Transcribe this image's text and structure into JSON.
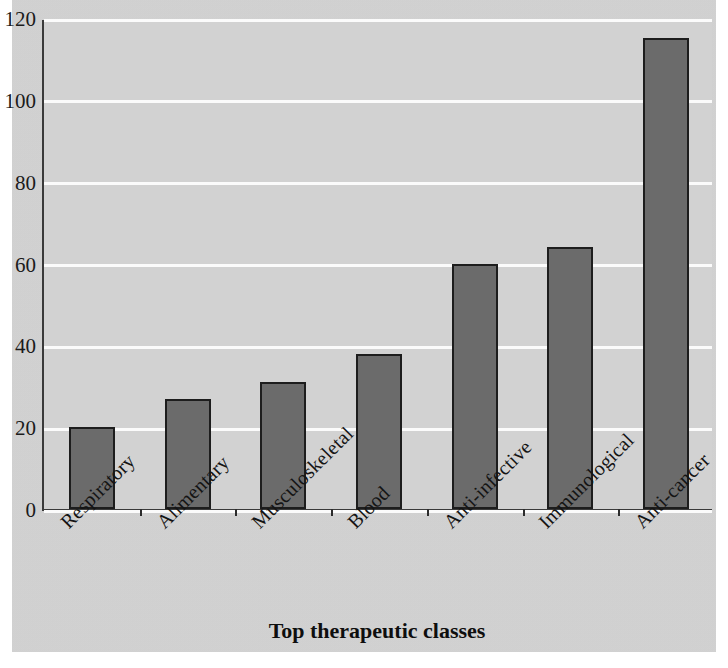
{
  "chart_data": {
    "type": "bar",
    "title": "Number of projects in development",
    "xlabel": "Top therapeutic classes",
    "ylabel": "",
    "categories": [
      "Respiratory",
      "Alimentary",
      "Musculoskeletal",
      "Blood",
      "Anti-infective",
      "Immunological",
      "Anti-cancer"
    ],
    "values": [
      20,
      27,
      31,
      38,
      60,
      64,
      115
    ],
    "ylim": [
      0,
      120
    ],
    "yticks": [
      0,
      20,
      40,
      60,
      80,
      100,
      120
    ],
    "ytick_labels": [
      "0",
      "20",
      "40",
      "60",
      "80",
      "100",
      "120"
    ],
    "grid": "horizontal-white",
    "legend": "none",
    "bar_color": "#6b6b6b",
    "bar_edge_color": "#1d1d1d",
    "plot_background": "#d2d2d2",
    "gridline_color": "#fbfbfb",
    "axis_color": "#3a3a3a",
    "label_rotation_deg": -45
  }
}
